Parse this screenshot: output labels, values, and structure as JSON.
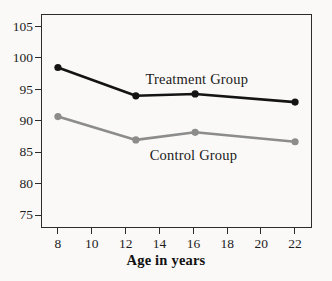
{
  "chart_data": {
    "type": "line",
    "title": "",
    "xlabel": "Age in years",
    "ylabel": "",
    "xlim": [
      7,
      23
    ],
    "ylim": [
      73,
      107
    ],
    "xticks": [
      8,
      10,
      12,
      14,
      16,
      18,
      20,
      22
    ],
    "yticks": [
      75,
      80,
      85,
      90,
      95,
      100,
      105
    ],
    "xtick_labels": [
      "8",
      "10",
      "12",
      "14",
      "16",
      "18",
      "20",
      "22"
    ],
    "ytick_labels": [
      "75",
      "80",
      "85",
      "90",
      "95",
      "100",
      "105"
    ],
    "grid": false,
    "legend": "inline-annotations",
    "series": [
      {
        "name": "Treatment Group",
        "color": "#141414",
        "marker": "circle",
        "x": [
          8,
          12.6,
          16.1,
          22
        ],
        "values": [
          98.5,
          94.0,
          94.3,
          93.0
        ],
        "annotation": {
          "text": "Treatment Group",
          "x": 16.2,
          "y": 96.7
        }
      },
      {
        "name": "Control Group",
        "color": "#8c8c8c",
        "marker": "circle",
        "x": [
          8,
          12.6,
          16.1,
          22
        ],
        "values": [
          90.7,
          87.0,
          88.2,
          86.7
        ],
        "annotation": {
          "text": "Control Group",
          "x": 16.0,
          "y": 84.6
        }
      }
    ]
  },
  "axis": {
    "frame_color": "#2c2c2c"
  }
}
